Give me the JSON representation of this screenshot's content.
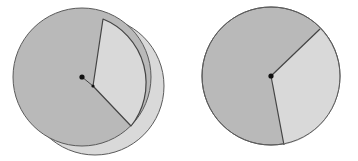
{
  "figure": {
    "width": 358,
    "height": 161,
    "background": "#ffffff",
    "colors": {
      "dark_sector": "#b9b9b9",
      "light_sector": "#d9d9d9",
      "outline": "#5a5a5a",
      "center_dot": "#111111"
    }
  },
  "left_pie": {
    "label": "",
    "center": [
      82,
      77
    ],
    "radius": 69,
    "offset_center": [
      95,
      86
    ],
    "offset_radius": 69,
    "wedge_apex": [
      93,
      86
    ],
    "wedge_top": [
      103,
      19
    ],
    "wedge_bottom": [
      131,
      126
    ],
    "sectors": [
      {
        "name": "large-dark-sector",
        "shade": "dark"
      },
      {
        "name": "small-light-sector",
        "shade": "light",
        "displaced": true
      }
    ]
  },
  "right_pie": {
    "label": "",
    "center": [
      271,
      76
    ],
    "radius": 69,
    "boundary_top": [
      320,
      29
    ],
    "boundary_bottom": [
      284,
      145
    ],
    "sectors": [
      {
        "name": "large-dark-sector",
        "shade": "dark"
      },
      {
        "name": "small-light-sector",
        "shade": "light"
      }
    ]
  }
}
